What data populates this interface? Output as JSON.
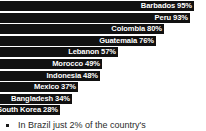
{
  "chart_data": {
    "type": "bar",
    "orientation": "horizontal",
    "title": "",
    "xlabel": "",
    "ylabel": "",
    "xlim": [
      0,
      100
    ],
    "grid": false,
    "legend": null,
    "value_suffix": "%",
    "categories": [
      "Barbados",
      "Peru",
      "Colombia",
      "Guatemala",
      "Lebanon",
      "Morocco",
      "Indonesia",
      "Mexico",
      "Bangladesh",
      "South Korea"
    ],
    "values": [
      95,
      93,
      80,
      76,
      57,
      49,
      48,
      37,
      34,
      28
    ],
    "bars": [
      {
        "label": "Barbados 95%",
        "category": "Barbados",
        "value": 95,
        "bar_color": "#111111",
        "label_color": "#ffffff"
      },
      {
        "label": "Peru 93%",
        "category": "Peru",
        "value": 93,
        "bar_color": "#111111",
        "label_color": "#ffffff"
      },
      {
        "label": "Colombia 80%",
        "category": "Colombia",
        "value": 80,
        "bar_color": "#111111",
        "label_color": "#ffffff"
      },
      {
        "label": "Guatemala 76%",
        "category": "Guatemala",
        "value": 76,
        "bar_color": "#111111",
        "label_color": "#ffffff"
      },
      {
        "label": "Lebanon 57%",
        "category": "Lebanon",
        "value": 57,
        "bar_color": "#111111",
        "label_color": "#ffffff"
      },
      {
        "label": "Morocco 49%",
        "category": "Morocco",
        "value": 49,
        "bar_color": "#111111",
        "label_color": "#ffffff"
      },
      {
        "label": "Indonesia 48%",
        "category": "Indonesia",
        "value": 48,
        "bar_color": "#111111",
        "label_color": "#ffffff"
      },
      {
        "label": "Mexico 37%",
        "category": "Mexico",
        "value": 37,
        "bar_color": "#111111",
        "label_color": "#ffffff"
      },
      {
        "label": "Bangladesh 34%",
        "category": "Bangladesh",
        "value": 34,
        "bar_color": "#111111",
        "label_color": "#ffffff"
      },
      {
        "label": "South Korea 28%",
        "category": "South Korea",
        "value": 28,
        "bar_color": "#111111",
        "label_color": "#ffffff"
      }
    ]
  },
  "footnote": {
    "bullet_icon": "square-bullet-icon",
    "text": "In Brazil just 2% of the country's"
  }
}
